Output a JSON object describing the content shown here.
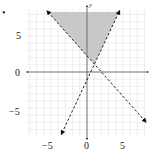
{
  "chart_data": {
    "type": "line",
    "title": "",
    "xlabel": "",
    "ylabel": "y",
    "xlim": [
      -8.3,
      8.2
    ],
    "ylim": [
      -8.9,
      8.8
    ],
    "grid": true,
    "x_ticks": [
      "-5",
      "0",
      "5"
    ],
    "y_ticks": [
      "5",
      "0",
      "-5"
    ],
    "series": [
      {
        "name": "boundary line 1 (dashed, decreasing)",
        "style": "dashed",
        "points": [
          [
            -5.4,
            8.3
          ],
          [
            8.1,
            -6.8
          ]
        ],
        "approx_equation": "y ≈ -1.1x + 2.3"
      },
      {
        "name": "boundary line 2 (dashed, increasing)",
        "style": "dashed",
        "points": [
          [
            -3.5,
            -8.6
          ],
          [
            4.4,
            8.3
          ]
        ],
        "approx_equation": "y ≈ 2.1x - 1.2"
      }
    ],
    "shaded_region": {
      "description": "region above both dashed lines",
      "vertices": [
        [
          -5.4,
          8.3
        ],
        [
          4.4,
          8.3
        ],
        [
          1.0,
          1.1
        ]
      ],
      "color": "#c8c8c8"
    },
    "intersection": [
      1.0,
      1.1
    ]
  },
  "labels": {
    "x_minus5": "−5",
    "x_0": "0",
    "x_5": "5",
    "y_5": "5",
    "y_0": "0",
    "y_minus5": "−5",
    "y_axis": "y",
    "bullet": "•"
  }
}
